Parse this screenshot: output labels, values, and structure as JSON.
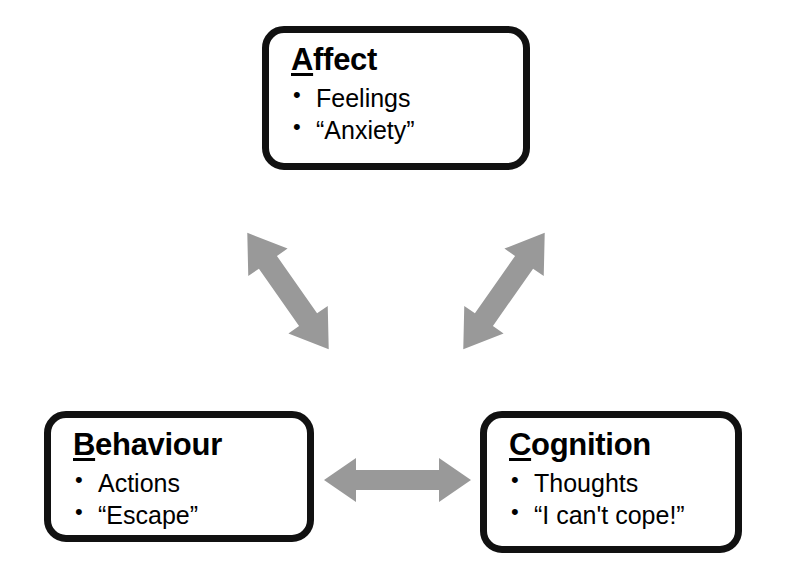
{
  "diagram": {
    "background_color": "#ffffff",
    "box_border_color": "#111111",
    "arrow_color": "#999999",
    "nodes": [
      {
        "id": "affect",
        "initial": "A",
        "rest": "ffect",
        "title": "Affect",
        "bullets": [
          "Feelings",
          "“Anxiety”"
        ]
      },
      {
        "id": "behaviour",
        "initial": "B",
        "rest": "ehaviour",
        "title": "Behaviour",
        "bullets": [
          "Actions",
          "“Escape”"
        ]
      },
      {
        "id": "cognition",
        "initial": "C",
        "rest": "ognition",
        "title": "Cognition",
        "bullets": [
          "Thoughts",
          "“I can't cope!”"
        ]
      }
    ],
    "connectors": [
      {
        "id": "affect-behaviour",
        "from": "affect",
        "to": "behaviour",
        "style": "double-headed",
        "orientation": "diagonal-down-left"
      },
      {
        "id": "affect-cognition",
        "from": "affect",
        "to": "cognition",
        "style": "double-headed",
        "orientation": "diagonal-down-right"
      },
      {
        "id": "behaviour-cognition",
        "from": "behaviour",
        "to": "cognition",
        "style": "double-headed",
        "orientation": "horizontal"
      }
    ]
  }
}
